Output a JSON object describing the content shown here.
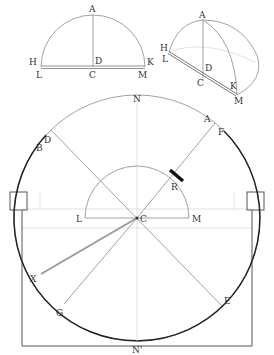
{
  "figure": {
    "type": "geometric-diagram",
    "panels": [
      {
        "id": "semicircle-flat",
        "labels": [
          "A",
          "H",
          "D",
          "K",
          "L",
          "C",
          "M"
        ]
      },
      {
        "id": "hemisphere-perspective",
        "labels": [
          "A",
          "H",
          "L",
          "D",
          "C",
          "K",
          "M"
        ]
      },
      {
        "id": "main-circle",
        "labels": [
          "N",
          "D",
          "B",
          "A",
          "F",
          "R",
          "L",
          "C",
          "M",
          "X",
          "G",
          "E",
          "N'"
        ]
      }
    ]
  },
  "labels": {
    "p1": {
      "A": "A",
      "H": "H",
      "D": "D",
      "K": "K",
      "L": "L",
      "C": "C",
      "M": "M"
    },
    "p2": {
      "A": "A",
      "H": "H",
      "L": "L",
      "D": "D",
      "C": "C",
      "K": "K",
      "M": "M"
    },
    "p3": {
      "N": "N",
      "D": "D",
      "B": "B",
      "A": "A",
      "F": "F",
      "R": "R",
      "L": "L",
      "C": "C",
      "M": "M",
      "X": "X",
      "G": "G",
      "E": "E",
      "Nprime": "N'"
    }
  },
  "colors": {
    "line_thin": "#8a8a8a",
    "line_faint": "#d4d4d4",
    "line_thick": "#222222",
    "label": "#333333",
    "background": "#ffffff"
  }
}
